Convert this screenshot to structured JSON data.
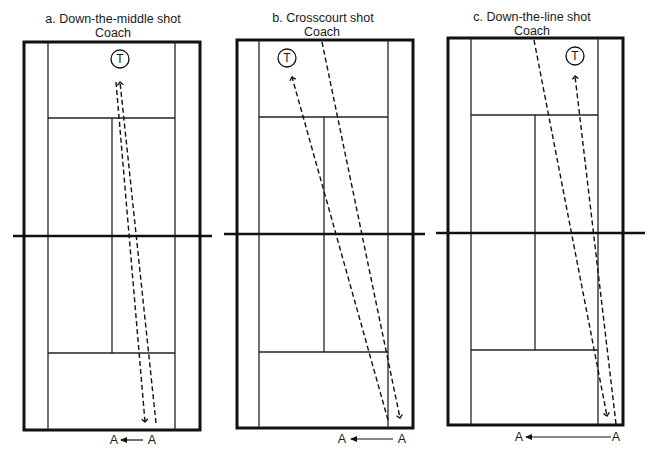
{
  "diagram": {
    "panels": [
      {
        "id": "a",
        "title": "a. Down-the-middle shot",
        "coach_label": "Coach",
        "coach_marker": "T",
        "shot_type": "down-the-middle",
        "player_label_from": "A",
        "player_label_to": "A",
        "title_x": 113,
        "coach_x": 113
      },
      {
        "id": "b",
        "title": "b. Crosscourt shot",
        "coach_label": "Coach",
        "coach_marker": "T",
        "shot_type": "crosscourt",
        "player_label_from": "A",
        "player_label_to": "A",
        "title_x": 323,
        "coach_x": 322
      },
      {
        "id": "c",
        "title": "c. Down-the-line shot",
        "coach_label": "Coach",
        "coach_marker": "T",
        "shot_type": "down-the-line",
        "player_label_from": "A",
        "player_label_to": "A",
        "title_x": 532,
        "coach_x": 532
      }
    ],
    "colors": {
      "line": "#111111",
      "background": "#ffffff"
    }
  }
}
